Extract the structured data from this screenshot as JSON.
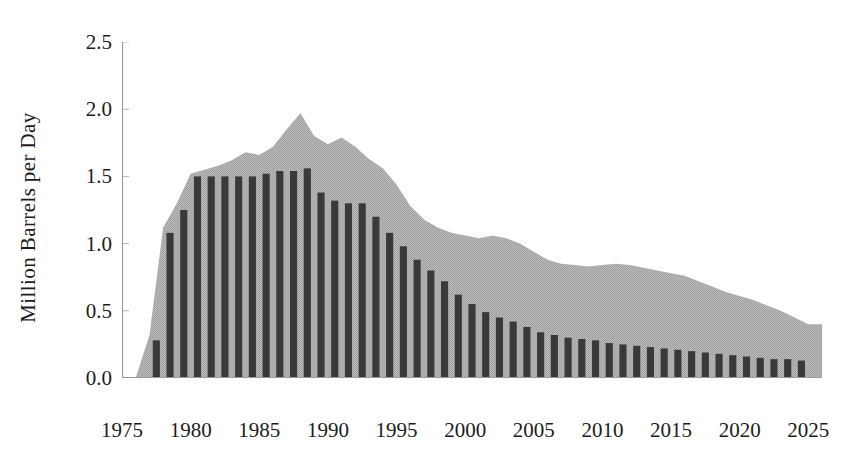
{
  "chart_data": {
    "type": "area",
    "title": "",
    "xlabel": "",
    "ylabel": "Million Barrels per Day",
    "xlim": [
      1975,
      2026
    ],
    "ylim": [
      0.0,
      2.5
    ],
    "grid": false,
    "legend": "none",
    "y_ticks": [
      "2.5",
      "2.0",
      "1.5",
      "1.0",
      "0.5",
      "0.0"
    ],
    "y_tick_values": [
      2.5,
      2.0,
      1.5,
      1.0,
      0.5,
      0.0
    ],
    "x_ticks": [
      "1975",
      "1980",
      "1985",
      "1990",
      "1995",
      "2000",
      "2005",
      "2010",
      "2015",
      "2020",
      "2025"
    ],
    "x_tick_values": [
      1975,
      1980,
      1985,
      1990,
      1995,
      2000,
      2005,
      2010,
      2015,
      2020,
      2025
    ],
    "colors": {
      "area_fill": "#b2b2b2",
      "bar_fill": "#3c3c3c",
      "axis": "#9a9a9a",
      "text": "#1c1c1c",
      "background": "#ffffff"
    },
    "series": [
      {
        "name": "Total (area)",
        "type": "area",
        "x": [
          1976,
          1977,
          1978,
          1979,
          1980,
          1981,
          1982,
          1983,
          1984,
          1985,
          1986,
          1987,
          1988,
          1989,
          1990,
          1991,
          1992,
          1993,
          1994,
          1995,
          1996,
          1997,
          1998,
          1999,
          2000,
          2001,
          2002,
          2003,
          2004,
          2005,
          2006,
          2007,
          2008,
          2009,
          2010,
          2011,
          2012,
          2013,
          2014,
          2015,
          2016,
          2017,
          2018,
          2019,
          2020,
          2021,
          2022,
          2023,
          2024,
          2025
        ],
        "values": [
          0.0,
          0.32,
          1.12,
          1.3,
          1.52,
          1.55,
          1.58,
          1.62,
          1.68,
          1.66,
          1.72,
          1.85,
          1.97,
          1.8,
          1.74,
          1.79,
          1.72,
          1.63,
          1.56,
          1.44,
          1.28,
          1.18,
          1.12,
          1.08,
          1.06,
          1.04,
          1.06,
          1.04,
          1.0,
          0.94,
          0.88,
          0.85,
          0.84,
          0.83,
          0.84,
          0.85,
          0.84,
          0.82,
          0.8,
          0.78,
          0.76,
          0.72,
          0.68,
          0.64,
          0.61,
          0.58,
          0.54,
          0.5,
          0.45,
          0.4
        ]
      },
      {
        "name": "Production (bars)",
        "type": "bar",
        "x": [
          1977,
          1978,
          1979,
          1980,
          1981,
          1982,
          1983,
          1984,
          1985,
          1986,
          1987,
          1988,
          1989,
          1990,
          1991,
          1992,
          1993,
          1994,
          1995,
          1996,
          1997,
          1998,
          1999,
          2000,
          2001,
          2002,
          2003,
          2004,
          2005,
          2006,
          2007,
          2008,
          2009,
          2010,
          2011,
          2012,
          2013,
          2014,
          2015,
          2016,
          2017,
          2018,
          2019,
          2020,
          2021,
          2022,
          2023,
          2024
        ],
        "values": [
          0.28,
          1.08,
          1.25,
          1.5,
          1.5,
          1.5,
          1.5,
          1.5,
          1.52,
          1.54,
          1.54,
          1.56,
          1.38,
          1.32,
          1.3,
          1.3,
          1.2,
          1.08,
          0.98,
          0.88,
          0.8,
          0.72,
          0.62,
          0.55,
          0.49,
          0.45,
          0.42,
          0.38,
          0.34,
          0.32,
          0.3,
          0.29,
          0.28,
          0.26,
          0.25,
          0.24,
          0.23,
          0.22,
          0.21,
          0.2,
          0.19,
          0.18,
          0.17,
          0.16,
          0.15,
          0.14,
          0.14,
          0.13
        ]
      }
    ]
  }
}
